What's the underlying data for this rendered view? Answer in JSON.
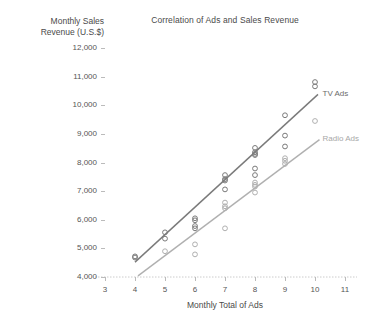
{
  "chart_data": {
    "type": "scatter",
    "title": "Correlation of Ads and Sales Revenue",
    "xlabel": "Monthly Total of Ads",
    "ylabel": "Monthly Sales Revenue (U.S.$)",
    "ylabel_line1": "Monthly Sales",
    "ylabel_line2": "Revenue (U.S.$)",
    "xlim": [
      3,
      11
    ],
    "ylim": [
      4000,
      12000
    ],
    "xticks": [
      3,
      4,
      5,
      6,
      7,
      8,
      9,
      10,
      11
    ],
    "xtick_labels": [
      "3",
      "4",
      "5",
      "6",
      "7",
      "8",
      "9",
      "10",
      "11"
    ],
    "yticks": [
      4000,
      5000,
      6000,
      7000,
      8000,
      9000,
      10000,
      11000,
      12000
    ],
    "ytick_labels": [
      "4,000",
      "5,000",
      "6,000",
      "7,000",
      "8,000",
      "9,000",
      "10,000",
      "11,000",
      "12,000"
    ],
    "grid": false,
    "legend_position": "inline-right",
    "series": [
      {
        "name": "TV Ads",
        "color": "#7a7a7a",
        "marker": "open-circle",
        "label_x": 10.25,
        "label_y": 10400,
        "points": [
          {
            "x": 4,
            "y": 4720
          },
          {
            "x": 4,
            "y": 4680
          },
          {
            "x": 5,
            "y": 5560
          },
          {
            "x": 5,
            "y": 5340
          },
          {
            "x": 6,
            "y": 6050
          },
          {
            "x": 6,
            "y": 5980
          },
          {
            "x": 6,
            "y": 5780
          },
          {
            "x": 6,
            "y": 5700
          },
          {
            "x": 7,
            "y": 7560
          },
          {
            "x": 7,
            "y": 7420
          },
          {
            "x": 7,
            "y": 7370
          },
          {
            "x": 7,
            "y": 7060
          },
          {
            "x": 8,
            "y": 8510
          },
          {
            "x": 8,
            "y": 8360
          },
          {
            "x": 8,
            "y": 8300
          },
          {
            "x": 8,
            "y": 8260
          },
          {
            "x": 8,
            "y": 7790
          },
          {
            "x": 8,
            "y": 7560
          },
          {
            "x": 9,
            "y": 9650
          },
          {
            "x": 9,
            "y": 8940
          },
          {
            "x": 9,
            "y": 8560
          },
          {
            "x": 10,
            "y": 10810
          },
          {
            "x": 10,
            "y": 10660
          }
        ],
        "trendline": {
          "x0": 4,
          "y0": 4520,
          "x1": 10.1,
          "y1": 10380
        }
      },
      {
        "name": "Radio Ads",
        "color": "#b0b0b0",
        "marker": "open-circle",
        "label_x": 10.25,
        "label_y": 8820,
        "points": [
          {
            "x": 5,
            "y": 4900
          },
          {
            "x": 6,
            "y": 5140
          },
          {
            "x": 6,
            "y": 4790
          },
          {
            "x": 7,
            "y": 6600
          },
          {
            "x": 7,
            "y": 6470
          },
          {
            "x": 7,
            "y": 6400
          },
          {
            "x": 7,
            "y": 5700
          },
          {
            "x": 8,
            "y": 7300
          },
          {
            "x": 8,
            "y": 7220
          },
          {
            "x": 8,
            "y": 7160
          },
          {
            "x": 8,
            "y": 6950
          },
          {
            "x": 9,
            "y": 8150
          },
          {
            "x": 9,
            "y": 8060
          },
          {
            "x": 9,
            "y": 7950
          },
          {
            "x": 10,
            "y": 9450
          }
        ],
        "trendline": {
          "x0": 4.1,
          "y0": 4040,
          "x1": 10.15,
          "y1": 8800
        }
      }
    ]
  }
}
